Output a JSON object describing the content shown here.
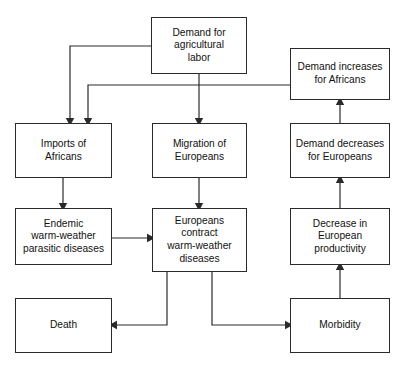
{
  "diagram": {
    "type": "flowchart",
    "title": "",
    "background_color": "#ffffff",
    "line_color": "#2a2a2a",
    "text_color": "#111111",
    "nodes": [
      {
        "id": "demand_labor",
        "label": "Demand for\nagricultural\nlabor",
        "x": 151,
        "y": 17,
        "w": 96,
        "h": 57
      },
      {
        "id": "demand_increases_africans",
        "label": "Demand increases\nfor Africans",
        "x": 290,
        "y": 48,
        "w": 100,
        "h": 52
      },
      {
        "id": "imports_africans",
        "label": "Imports of\nAfricans",
        "x": 15,
        "y": 123,
        "w": 97,
        "h": 55
      },
      {
        "id": "migration_europeans",
        "label": "Migration of\nEuropeans",
        "x": 152,
        "y": 123,
        "w": 95,
        "h": 55
      },
      {
        "id": "demand_decreases_europeans",
        "label": "Demand decreases\nfor Europeans",
        "x": 290,
        "y": 123,
        "w": 100,
        "h": 55
      },
      {
        "id": "endemic_diseases",
        "label": "Endemic\nwarm-weather\nparasitic diseases",
        "x": 15,
        "y": 208,
        "w": 97,
        "h": 57
      },
      {
        "id": "europeans_contract",
        "label": "Europeans\ncontract\nwarm-weather\ndiseases",
        "x": 152,
        "y": 208,
        "w": 95,
        "h": 64
      },
      {
        "id": "decrease_productivity",
        "label": "Decrease in\nEuropean\nproductivity",
        "x": 290,
        "y": 208,
        "w": 100,
        "h": 57
      },
      {
        "id": "death",
        "label": "Death",
        "x": 15,
        "y": 298,
        "w": 97,
        "h": 55
      },
      {
        "id": "morbidity",
        "label": "Morbidity",
        "x": 290,
        "y": 298,
        "w": 100,
        "h": 55
      }
    ],
    "edges": [
      {
        "id": "edge-demand-labor-to-imports",
        "from": "demand_labor",
        "to": "imports_africans",
        "points": "151,46 70,46 70,118",
        "arrow": "down"
      },
      {
        "id": "edge-demand-labor-to-migration",
        "from": "demand_labor",
        "to": "migration_europeans",
        "points": "199,74 199,118",
        "arrow": "down"
      },
      {
        "id": "edge-demand-increases-to-imports",
        "from": "demand_increases_africans",
        "to": "imports_africans",
        "points": "290,85 88,85 88,118",
        "arrow": "down"
      },
      {
        "id": "edge-imports-to-endemic",
        "from": "imports_africans",
        "to": "endemic_diseases",
        "points": "63,178 63,203",
        "arrow": "down"
      },
      {
        "id": "edge-migration-to-contract",
        "from": "migration_europeans",
        "to": "europeans_contract",
        "points": "199,178 199,203",
        "arrow": "down"
      },
      {
        "id": "edge-endemic-to-contract",
        "from": "endemic_diseases",
        "to": "europeans_contract",
        "points": "112,238 147,238",
        "arrow": "right"
      },
      {
        "id": "edge-contract-to-death",
        "from": "europeans_contract",
        "to": "death",
        "points": "167,272 167,325 117,325",
        "arrow": "left"
      },
      {
        "id": "edge-contract-to-morbidity",
        "from": "europeans_contract",
        "to": "morbidity",
        "points": "212,272 212,325 285,325",
        "arrow": "right"
      },
      {
        "id": "edge-morbidity-to-productivity",
        "from": "morbidity",
        "to": "decrease_productivity",
        "points": "340,298 340,270",
        "arrow": "up"
      },
      {
        "id": "edge-productivity-to-demand-decreases",
        "from": "decrease_productivity",
        "to": "demand_decreases_europeans",
        "points": "340,208 340,183",
        "arrow": "up"
      },
      {
        "id": "edge-demand-decreases-to-demand-increases",
        "from": "demand_decreases_europeans",
        "to": "demand_increases_africans",
        "points": "340,123 340,105",
        "arrow": "up"
      }
    ]
  }
}
